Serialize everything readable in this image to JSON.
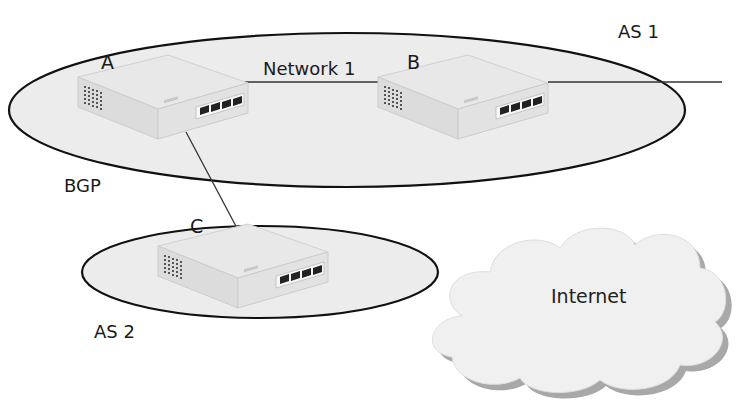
{
  "diagram": {
    "autonomous_systems": [
      {
        "id": "as1",
        "label": "AS 1"
      },
      {
        "id": "as2",
        "label": "AS 2"
      }
    ],
    "routers": [
      {
        "id": "A",
        "label": "A",
        "system": "AS 1"
      },
      {
        "id": "B",
        "label": "B",
        "system": "AS 1"
      },
      {
        "id": "C",
        "label": "C",
        "system": "AS 2"
      }
    ],
    "links": [
      {
        "from": "A",
        "to": "B",
        "label": "Network 1"
      },
      {
        "from": "A",
        "to": "C",
        "label": "BGP"
      },
      {
        "from": "B",
        "to": "external",
        "label": ""
      }
    ],
    "labels": {
      "router_a": "A",
      "router_b": "B",
      "router_c": "C",
      "network1": "Network 1",
      "bgp": "BGP",
      "as1": "AS 1",
      "as2": "AS 2",
      "internet": "Internet"
    },
    "colors": {
      "ellipse_fill": "#ececec",
      "ellipse_stroke": "#111111",
      "router_body": "#e4e4e4",
      "cloud_fill": "#f0f0f0",
      "cloud_shadow": "#a8a8a8"
    }
  }
}
